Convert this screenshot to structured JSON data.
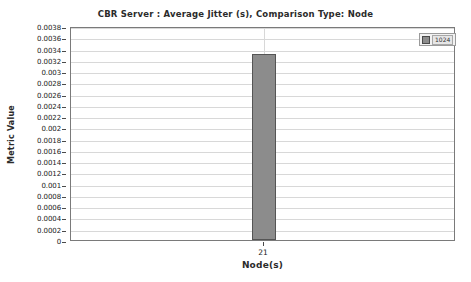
{
  "chart_data": {
    "type": "bar",
    "title": "CBR Server :  Average Jitter (s), Comparison Type: Node",
    "xlabel": "Node(s)",
    "ylabel": "Metric Value",
    "categories": [
      "21"
    ],
    "values": [
      0.0033
    ],
    "series": [
      {
        "name": "1024",
        "values": [
          0.0033
        ]
      }
    ],
    "ylim": [
      0,
      0.0038
    ],
    "ytick_labels": [
      "0.0038",
      "0.0036",
      "0.0034",
      "0.0032",
      "0.003",
      "0.0028",
      "0.0026",
      "0.0024",
      "0.0022",
      "0.002",
      "0.0018",
      "0.0016",
      "0.0014",
      "0.0012",
      "0.001",
      "0.0008",
      "0.0006",
      "0.0004",
      "0.0002",
      "0"
    ],
    "ytick_values": [
      0.0038,
      0.0036,
      0.0034,
      0.0032,
      0.003,
      0.0028,
      0.0026,
      0.0024,
      0.0022,
      0.002,
      0.0018,
      0.0016,
      0.0014,
      0.0012,
      0.001,
      0.0008,
      0.0006,
      0.0004,
      0.0002,
      0
    ],
    "grid": true,
    "legend_position": "top-right",
    "bar_color": "#8c8c8c",
    "bar_edge_color": "#555555",
    "grid_color": "#d8d8d8",
    "frame_color": "#7a7a7a",
    "text_color": "#2b2b2b"
  },
  "legend": {
    "entries": [
      {
        "label": "1024",
        "color": "#8c8c8c"
      }
    ]
  }
}
